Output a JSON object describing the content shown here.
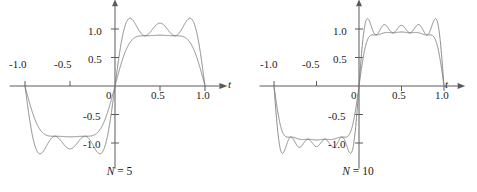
{
  "figure": {
    "title": ""
  },
  "panels": [
    {
      "id": "left",
      "caption_symbol": "N",
      "caption_eq": " = ",
      "caption_value": "5",
      "caption_full": "N = 5",
      "axis_label_x": "t",
      "x_ticks": [
        "-1.0",
        "-0.5",
        "0",
        "0.5",
        "1.0"
      ],
      "y_ticks": [
        "1.0",
        "0.5",
        "-0.5",
        "-1.0"
      ],
      "origin_label": "0"
    },
    {
      "id": "right",
      "caption_symbol": "N",
      "caption_eq": " = ",
      "caption_value": "10",
      "caption_full": "N = 10",
      "axis_label_x": "t",
      "x_ticks": [
        "-1.0",
        "-0.5",
        "0",
        "0.5",
        "1.0"
      ],
      "y_ticks": [
        "1.0",
        "0.5",
        "-0.5",
        "-1.0"
      ],
      "origin_label": "0"
    }
  ],
  "chart_data": {
    "type": "line",
    "title": "",
    "xlabel": "t",
    "ylabel": "",
    "xlim": [
      -1.12,
      1.12
    ],
    "ylim": [
      -1.42,
      1.42
    ],
    "grid": false,
    "legend": "none",
    "xticks": [
      -1.0,
      -0.5,
      0,
      0.5,
      1.0
    ],
    "xticklabels": [
      "-1.0",
      "-0.5",
      "0",
      "0.5",
      "1.0"
    ],
    "yticks": [
      1.0,
      0.5,
      -0.5,
      -1.0
    ],
    "yticklabels": [
      "1.0",
      "0.5",
      "-0.5",
      "-1.0"
    ],
    "subplots": [
      {
        "name": "N = 5",
        "N": 5,
        "series": [
          {
            "name": "Fourier partial sum",
            "kind": "partial-sum",
            "overshoot_peak": 1.18,
            "overshoot_peak_t": 0.78,
            "undershoot_min": -1.18,
            "undershoot_min_t": -0.78
          },
          {
            "name": "Smoothed (Fejer) sum",
            "kind": "cesaro-sum",
            "peak": 0.8,
            "peak_t": 0.75,
            "min": -0.8,
            "min_t": -0.75
          }
        ]
      },
      {
        "name": "N = 10",
        "N": 10,
        "series": [
          {
            "name": "Fourier partial sum",
            "kind": "partial-sum",
            "overshoot_peak": 1.18,
            "overshoot_peak_t": 0.9,
            "undershoot_min": -1.18,
            "undershoot_min_t": -0.9
          },
          {
            "name": "Smoothed (Fejer) sum",
            "kind": "cesaro-sum",
            "peak": 0.92,
            "peak_t": 0.75,
            "min": -0.92,
            "min_t": -0.75
          }
        ]
      }
    ]
  },
  "geometry": {
    "left_panel": {
      "x0": 115,
      "y0": 86,
      "px_per_unit_x": 90,
      "px_per_unit_y": 57
    },
    "right_panel": {
      "x0": 120,
      "y0": 86,
      "px_per_unit_x": 85,
      "px_per_unit_y": 57
    }
  },
  "colors": {
    "curve": "#7a7a7a",
    "axis": "#5a5a5a",
    "text": "#1a1a1a",
    "background": "#ffffff"
  }
}
